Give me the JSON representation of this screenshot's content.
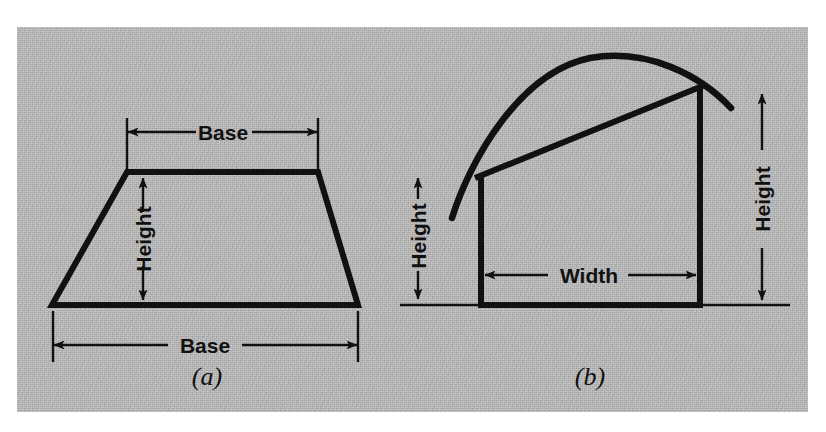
{
  "figure": {
    "panel_background": "#b9b9b9",
    "ink_color": "#111111",
    "page_background": "#ffffff"
  },
  "panel_a": {
    "caption": "(a)",
    "shape": "trapezoid",
    "labels": {
      "top_base": "Base",
      "bottom_base": "Base",
      "height": "Height"
    }
  },
  "panel_b": {
    "caption": "(b)",
    "shape": "rectangle-under-curve",
    "labels": {
      "width": "Width",
      "height_left": "Height",
      "height_right": "Height"
    }
  }
}
